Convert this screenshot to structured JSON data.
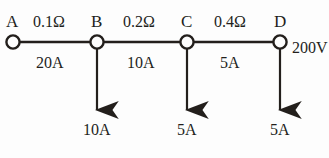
{
  "diagram": {
    "ink_color": "#231f1c",
    "background_color": "#fdfdfd",
    "nodes": [
      {
        "id": "A",
        "label": "A",
        "x": 13,
        "y": 42
      },
      {
        "id": "B",
        "label": "B",
        "x": 97,
        "y": 42
      },
      {
        "id": "C",
        "label": "C",
        "x": 187,
        "y": 42
      },
      {
        "id": "D",
        "label": "D",
        "x": 280,
        "y": 42
      }
    ],
    "segments": [
      {
        "from": "A",
        "to": "B",
        "resistance": "0.1Ω",
        "current": "20A"
      },
      {
        "from": "B",
        "to": "C",
        "resistance": "0.2Ω",
        "current": "10A"
      },
      {
        "from": "C",
        "to": "D",
        "resistance": "0.4Ω",
        "current": "5A"
      }
    ],
    "branches": [
      {
        "node": "B",
        "current": "10A"
      },
      {
        "node": "C",
        "current": "5A"
      },
      {
        "node": "D",
        "current": "5A"
      }
    ],
    "source": {
      "label": "200V",
      "at_node": "D",
      "clipped": true
    }
  }
}
